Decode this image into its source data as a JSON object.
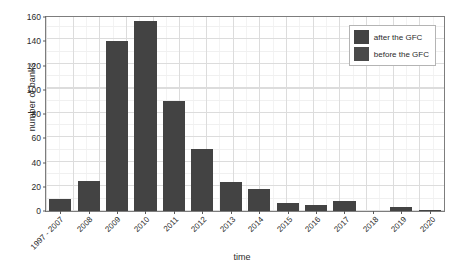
{
  "chart_data": {
    "type": "bar",
    "title": "",
    "xlabel": "time",
    "ylabel": "number of banks",
    "categories": [
      "1997 - 2007",
      "2008",
      "2009",
      "2010",
      "2011",
      "2012",
      "2013",
      "2014",
      "2015",
      "2016",
      "2017",
      "2018",
      "2019",
      "2020"
    ],
    "values": [
      10,
      25,
      140,
      157,
      91,
      51,
      24,
      18,
      7,
      5,
      8,
      0,
      3,
      1
    ],
    "series": [
      {
        "name": "number of banks",
        "values": [
          10,
          25,
          140,
          157,
          91,
          51,
          24,
          18,
          7,
          5,
          8,
          0,
          3,
          1
        ]
      }
    ],
    "ylim": [
      0,
      160
    ],
    "yticks": [
      0,
      20,
      40,
      60,
      80,
      100,
      120,
      140,
      160
    ],
    "ytick_labels": [
      "0",
      "20",
      "40",
      "60",
      "80",
      "100",
      "120",
      "140",
      "160"
    ],
    "grid": true,
    "grid_minor": true,
    "legend_position": "top-right",
    "legend": [
      {
        "label": "after the GFC",
        "color": "#434343"
      },
      {
        "label": "before the GFC",
        "color": "#4a4a4a"
      }
    ],
    "bar_color": "#434343",
    "plot_background": "#ffffff",
    "grid_color": "#dcdcdc",
    "axis_color": "#7d7d7d",
    "text_color": "#2b2b2b"
  }
}
